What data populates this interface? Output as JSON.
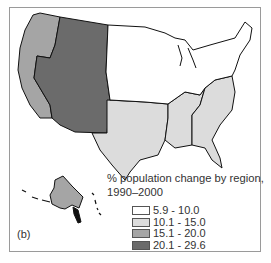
{
  "figure": {
    "panel_label": "(b)",
    "legend": {
      "title_line1": "% population change by region,",
      "title_line2": "1990–2000",
      "items": [
        {
          "label": "5.9 - 10.0",
          "color": "#ffffff"
        },
        {
          "label": "10.1 - 15.0",
          "color": "#dcdcdc"
        },
        {
          "label": "15.1 - 20.0",
          "color": "#a5a5a5"
        },
        {
          "label": "20.1 - 29.6",
          "color": "#6b6b6b"
        }
      ]
    },
    "regions": [
      {
        "name": "Pacific",
        "class": "15.1 - 20.0",
        "color": "#a5a5a5"
      },
      {
        "name": "Mountain",
        "class": "20.1 - 29.6",
        "color": "#6b6b6b"
      },
      {
        "name": "West North Central / Midwest / Northeast",
        "class": "5.9 - 10.0",
        "color": "#ffffff"
      },
      {
        "name": "West South Central",
        "class": "10.1 - 15.0",
        "color": "#dcdcdc"
      },
      {
        "name": "East South Central",
        "class": "10.1 - 15.0",
        "color": "#dcdcdc"
      },
      {
        "name": "South Atlantic",
        "class": "10.1 - 15.0",
        "color": "#dcdcdc"
      },
      {
        "name": "Alaska (Pacific)",
        "class": "15.1 - 20.0",
        "color": "#a5a5a5"
      }
    ]
  }
}
